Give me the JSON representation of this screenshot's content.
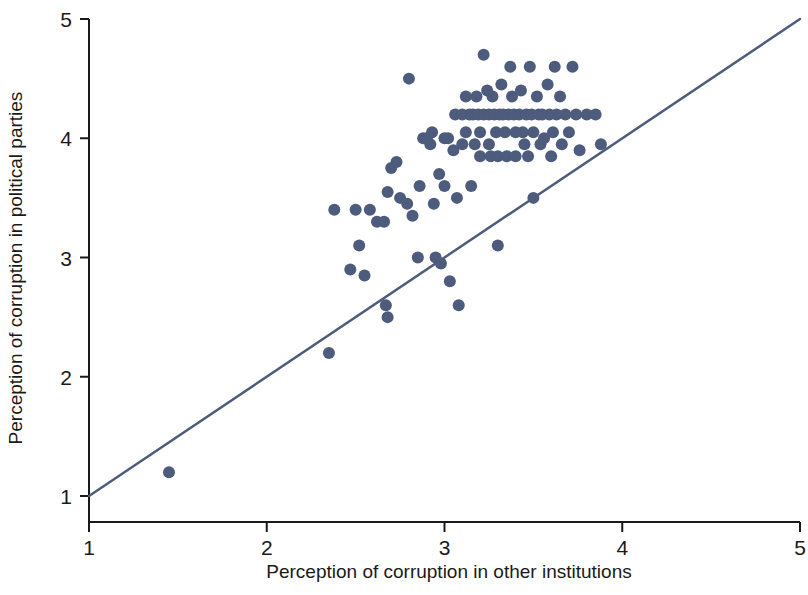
{
  "chart_data": {
    "type": "scatter",
    "title": "",
    "xlabel": "Perception of corruption in other institutions",
    "ylabel": "Perception of corruption in political parties",
    "xlim": [
      1,
      5
    ],
    "ylim": [
      1,
      5
    ],
    "xticks": [
      1,
      2,
      3,
      4,
      5
    ],
    "yticks": [
      1,
      2,
      3,
      4,
      5
    ],
    "xticklabels": [
      "1",
      "2",
      "3",
      "4",
      "5"
    ],
    "yticklabels": [
      "1",
      "2",
      "3",
      "4",
      "5"
    ],
    "grid": false,
    "legend": null,
    "marker": {
      "shape": "circle",
      "color": "#4d5b7c",
      "size": 12
    },
    "reference_line": {
      "name": "45-degree identity line",
      "color": "#4d5b7c",
      "width": 2.5,
      "x0": 1,
      "y0": 1,
      "x1": 5,
      "y1": 5
    },
    "points": [
      [
        1.45,
        1.2
      ],
      [
        2.35,
        2.2
      ],
      [
        2.38,
        3.4
      ],
      [
        2.47,
        2.9
      ],
      [
        2.5,
        3.4
      ],
      [
        2.52,
        3.1
      ],
      [
        2.55,
        2.85
      ],
      [
        2.58,
        3.4
      ],
      [
        2.62,
        3.3
      ],
      [
        2.66,
        3.3
      ],
      [
        2.67,
        2.6
      ],
      [
        2.68,
        2.5
      ],
      [
        2.68,
        3.55
      ],
      [
        2.7,
        3.75
      ],
      [
        2.73,
        3.8
      ],
      [
        2.75,
        3.5
      ],
      [
        2.79,
        3.45
      ],
      [
        2.8,
        4.5
      ],
      [
        2.82,
        3.35
      ],
      [
        2.85,
        3.0
      ],
      [
        2.86,
        3.6
      ],
      [
        2.88,
        4.0
      ],
      [
        2.9,
        4.0
      ],
      [
        2.92,
        3.95
      ],
      [
        2.93,
        4.05
      ],
      [
        2.94,
        3.45
      ],
      [
        2.95,
        3.0
      ],
      [
        2.97,
        3.7
      ],
      [
        2.98,
        2.95
      ],
      [
        3.0,
        4.0
      ],
      [
        3.0,
        3.6
      ],
      [
        3.02,
        4.0
      ],
      [
        3.03,
        2.8
      ],
      [
        3.05,
        3.9
      ],
      [
        3.06,
        4.2
      ],
      [
        3.07,
        3.5
      ],
      [
        3.08,
        2.6
      ],
      [
        3.1,
        4.2
      ],
      [
        3.1,
        3.95
      ],
      [
        3.12,
        4.05
      ],
      [
        3.12,
        4.35
      ],
      [
        3.14,
        4.2
      ],
      [
        3.15,
        3.6
      ],
      [
        3.16,
        4.2
      ],
      [
        3.17,
        3.95
      ],
      [
        3.18,
        4.35
      ],
      [
        3.19,
        4.2
      ],
      [
        3.2,
        4.05
      ],
      [
        3.2,
        3.85
      ],
      [
        3.22,
        4.7
      ],
      [
        3.22,
        4.2
      ],
      [
        3.24,
        4.4
      ],
      [
        3.25,
        4.2
      ],
      [
        3.25,
        3.95
      ],
      [
        3.26,
        3.85
      ],
      [
        3.27,
        4.35
      ],
      [
        3.28,
        4.2
      ],
      [
        3.29,
        4.05
      ],
      [
        3.3,
        3.85
      ],
      [
        3.3,
        3.1
      ],
      [
        3.31,
        4.2
      ],
      [
        3.32,
        4.45
      ],
      [
        3.33,
        4.2
      ],
      [
        3.34,
        4.05
      ],
      [
        3.35,
        3.85
      ],
      [
        3.36,
        4.2
      ],
      [
        3.37,
        4.6
      ],
      [
        3.38,
        4.35
      ],
      [
        3.39,
        4.2
      ],
      [
        3.4,
        4.05
      ],
      [
        3.4,
        3.85
      ],
      [
        3.42,
        4.2
      ],
      [
        3.43,
        4.4
      ],
      [
        3.44,
        4.05
      ],
      [
        3.45,
        3.95
      ],
      [
        3.46,
        4.2
      ],
      [
        3.47,
        3.85
      ],
      [
        3.48,
        4.6
      ],
      [
        3.49,
        4.2
      ],
      [
        3.5,
        4.05
      ],
      [
        3.5,
        3.5
      ],
      [
        3.52,
        4.35
      ],
      [
        3.53,
        4.2
      ],
      [
        3.54,
        3.95
      ],
      [
        3.55,
        4.2
      ],
      [
        3.56,
        4.0
      ],
      [
        3.58,
        4.45
      ],
      [
        3.59,
        4.2
      ],
      [
        3.6,
        3.85
      ],
      [
        3.61,
        4.05
      ],
      [
        3.62,
        4.6
      ],
      [
        3.63,
        4.2
      ],
      [
        3.65,
        4.35
      ],
      [
        3.66,
        3.95
      ],
      [
        3.68,
        4.2
      ],
      [
        3.7,
        4.05
      ],
      [
        3.72,
        4.6
      ],
      [
        3.74,
        4.2
      ],
      [
        3.76,
        3.9
      ],
      [
        3.8,
        4.2
      ],
      [
        3.85,
        4.2
      ],
      [
        3.88,
        3.95
      ]
    ]
  },
  "axes": {
    "x_tick_labels": [
      "1",
      "2",
      "3",
      "4",
      "5"
    ],
    "y_tick_labels": [
      "1",
      "2",
      "3",
      "4",
      "5"
    ],
    "x_axis_title": "Perception of corruption in other institutions",
    "y_axis_title": "Perception of corruption in political parties"
  },
  "colors": {
    "marker": "#4d5b7c",
    "line": "#4d5b7c",
    "axis": "#1a1a1a",
    "background": "#ffffff"
  }
}
